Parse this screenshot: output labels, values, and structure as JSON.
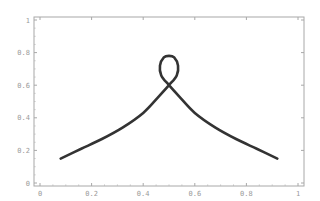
{
  "chart_data": {
    "type": "line",
    "title": "",
    "xlabel": "",
    "ylabel": "",
    "xlim": [
      0,
      1
    ],
    "ylim": [
      0,
      1
    ],
    "grid": false,
    "legend": null,
    "x_ticks": [
      "0",
      "0.2",
      "0.4",
      "0.6",
      "0.8",
      "1"
    ],
    "y_ticks": [
      "0",
      "0.2",
      "0.4",
      "0.6",
      "0.8",
      "1"
    ],
    "series": [
      {
        "name": "curve",
        "color": "#333333",
        "description": "Parametric curve rising from left, forming a small loop near x=0.5 (crossing at y≈0.6, loop top y≈0.78), then descending to right",
        "points": [
          [
            0.08,
            0.15
          ],
          [
            0.16,
            0.21
          ],
          [
            0.24,
            0.27
          ],
          [
            0.32,
            0.34
          ],
          [
            0.4,
            0.43
          ],
          [
            0.46,
            0.53
          ],
          [
            0.5,
            0.6
          ],
          [
            0.53,
            0.66
          ],
          [
            0.535,
            0.72
          ],
          [
            0.52,
            0.77
          ],
          [
            0.5,
            0.78
          ],
          [
            0.48,
            0.77
          ],
          [
            0.465,
            0.72
          ],
          [
            0.47,
            0.66
          ],
          [
            0.5,
            0.6
          ],
          [
            0.54,
            0.53
          ],
          [
            0.6,
            0.43
          ],
          [
            0.68,
            0.34
          ],
          [
            0.76,
            0.27
          ],
          [
            0.84,
            0.21
          ],
          [
            0.92,
            0.15
          ]
        ]
      }
    ]
  }
}
